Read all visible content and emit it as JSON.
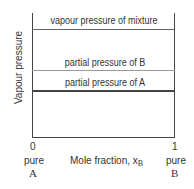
{
  "diagram": {
    "y_axis_label": "Vapour pressure",
    "x_axis_label": "Mole fraction, x",
    "x_axis_subscript": "B",
    "left_tick": "0",
    "right_tick": "1",
    "left_end_label": [
      "pure",
      "A"
    ],
    "right_end_label": [
      "pure",
      "B"
    ],
    "lines": [
      {
        "label": "vapour pressure of mixture",
        "color": "#666666"
      },
      {
        "label": "partial pressure of B",
        "color": "#888888"
      },
      {
        "label": "partial pressure of A",
        "color": "#444444"
      }
    ]
  }
}
